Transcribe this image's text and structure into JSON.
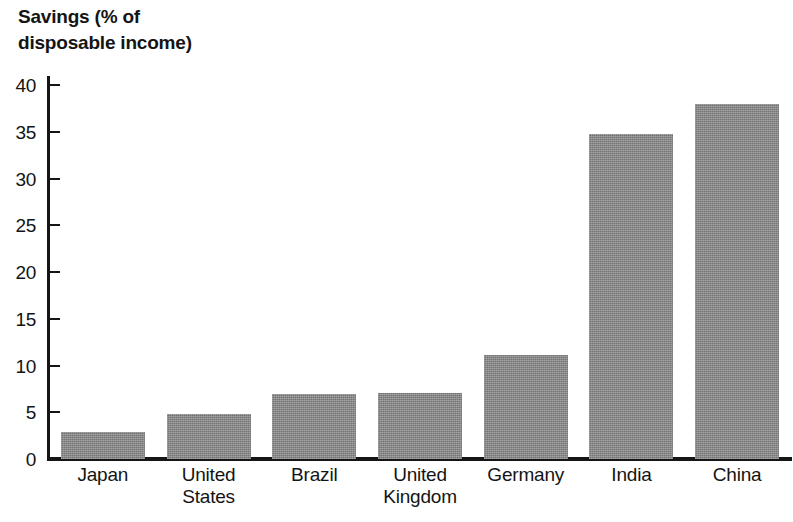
{
  "chart_data": {
    "type": "bar",
    "title": "Savings (% of\ndisposable income)",
    "xlabel": "",
    "ylabel": "Savings (% of disposable income)",
    "ylim": [
      0,
      40
    ],
    "ytick_step": 5,
    "yticks": [
      "40",
      "35",
      "30",
      "25",
      "20",
      "15",
      "10",
      "5",
      "0"
    ],
    "ytick_values": [
      40,
      35,
      30,
      25,
      20,
      15,
      10,
      5,
      0
    ],
    "grid": false,
    "legend": "none",
    "bar_color": "#8b8b8b",
    "axis_color": "#151515",
    "background": "#ffffff",
    "categories": [
      "Japan",
      "United\nStates",
      "Brazil",
      "United\nKingdom",
      "Germany",
      "India",
      "China"
    ],
    "values": [
      2.9,
      4.8,
      6.9,
      7.1,
      11.1,
      34.8,
      38.0
    ]
  }
}
